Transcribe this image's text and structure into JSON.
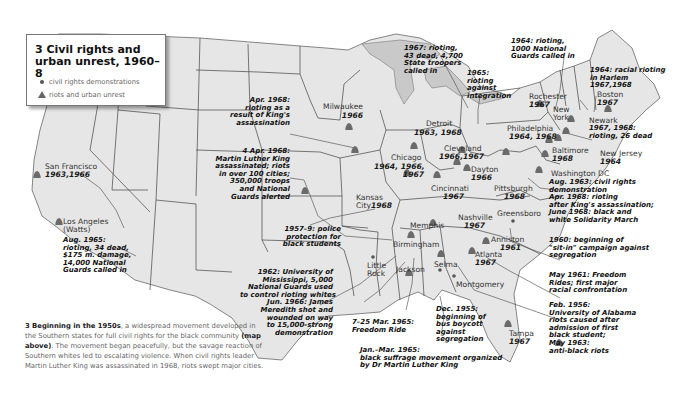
{
  "legend": {
    "title": "3 Civil rights and urban unrest, 1960–8",
    "items": [
      {
        "symbol": "dot-icon",
        "label": "civil rights demonstrations"
      },
      {
        "symbol": "riot-marker-icon",
        "label": "riots and urban unrest"
      }
    ]
  },
  "colors": {
    "land": "#e6e6e6",
    "borders": "#444444",
    "lakes": "#c9c9c9",
    "markers": "#6a6a6a",
    "background": "#ffffff"
  },
  "places": [
    {
      "id": "san-francisco",
      "name": "San Francisco",
      "years": "1963,1966",
      "type": "riot"
    },
    {
      "id": "los-angeles",
      "name": "Los Angeles (Watts)",
      "name_line1": "Los Angeles",
      "name_line2": "(Watts)",
      "type": "riot",
      "note": [
        "Aug. 1965:",
        "rioting, 34 dead,",
        "$175 m. damage,",
        "14,000 National",
        "Guards called in"
      ]
    },
    {
      "id": "milwaukee",
      "name": "Milwaukee",
      "years": "1966",
      "type": "riot"
    },
    {
      "id": "detroit",
      "name": "Detroit",
      "years": "1963, 1968",
      "type": "riot"
    },
    {
      "id": "chicago",
      "name": "Chicago",
      "years_line1": "1964, 1966,",
      "years_line2": "1967",
      "type": "riot"
    },
    {
      "id": "kansas-city",
      "name_line1": "Kansas",
      "name_line2": "City",
      "years": "1968",
      "type": "riot"
    },
    {
      "id": "cleveland",
      "name": "Cleveland",
      "years": "1966,1967",
      "type": "riot"
    },
    {
      "id": "dayton",
      "name": "Dayton",
      "years": "1966",
      "type": "riot"
    },
    {
      "id": "cincinnati",
      "name": "Cincinnati",
      "years": "1967",
      "type": "riot"
    },
    {
      "id": "pittsburgh",
      "name": "Pittsburgh",
      "years": "1968",
      "type": "riot"
    },
    {
      "id": "rochester",
      "name": "Rochester",
      "years": "1967",
      "type": "riot"
    },
    {
      "id": "boston",
      "name": "Boston",
      "years": "1967",
      "type": "riot"
    },
    {
      "id": "new-york",
      "name_line1": "New",
      "name_line2": "York",
      "type": "riot"
    },
    {
      "id": "newark",
      "name": "Newark",
      "note": [
        "1967, 1968:",
        "rioting, 26 dead"
      ],
      "type": "riot"
    },
    {
      "id": "new-jersey",
      "name": "New Jersey",
      "years": "1964",
      "type": "riot"
    },
    {
      "id": "philadelphia",
      "name": "Philadelphia",
      "years": "1964, 1968",
      "type": "riot"
    },
    {
      "id": "baltimore",
      "name": "Baltimore",
      "years": "1968",
      "type": "riot"
    },
    {
      "id": "washington-dc",
      "name": "Washington DC",
      "type": "riot",
      "note": [
        "Aug. 1963: civil rights",
        "demonstration",
        "Apr. 1968: rioting",
        "after King's assassination;",
        "June 1968: black and",
        "white Solidarity March"
      ]
    },
    {
      "id": "greensboro",
      "name": "Greensboro",
      "type": "demonstration"
    },
    {
      "id": "nashville",
      "name": "Nashville",
      "years": "1967",
      "type": "riot"
    },
    {
      "id": "memphis",
      "name": "Memphis",
      "type": "riot"
    },
    {
      "id": "little-rock",
      "name_line1": "Little",
      "name_line2": "Rock",
      "type": "demonstration"
    },
    {
      "id": "anniston",
      "name": "Anniston",
      "years": "1961",
      "type": "riot"
    },
    {
      "id": "atlanta",
      "name": "Atlanta",
      "years": "1967",
      "type": "riot"
    },
    {
      "id": "birmingham",
      "name": "Birmingham",
      "type": "riot"
    },
    {
      "id": "jackson",
      "name": "Jackson",
      "type": "riot"
    },
    {
      "id": "selma",
      "name": "Selma",
      "type": "demonstration"
    },
    {
      "id": "montgomery",
      "name": "Montgomery",
      "type": "demonstration"
    },
    {
      "id": "tampa",
      "name": "Tampa",
      "years": "1967",
      "type": "riot"
    }
  ],
  "annotations": {
    "detroit_1967": [
      "1967: rioting,",
      "43 dead, 4,700",
      "State troopers",
      "called in"
    ],
    "integration_1965": [
      "1965:",
      "rioting",
      "against",
      "integration"
    ],
    "rochester_1964": [
      "1964: rioting,",
      "1000 National",
      "Guards called in"
    ],
    "harlem_1964": [
      "1964: racial rioting",
      "in Harlem",
      "1967,1968"
    ],
    "chicago_apr_1968": [
      "Apr. 1968:",
      "rioting as a",
      "result of King's",
      "assassination"
    ],
    "memphis_4apr_1968": [
      "4 Apr. 1968:",
      "Martin Luther King",
      "assassinated; riots",
      "in over 100 cities;",
      "350,000 troops",
      "and National",
      "Guards alerted"
    ],
    "little_rock_1957": [
      "1957–9: police",
      "protection for",
      "black students"
    ],
    "jackson_1962": [
      "1962: University of",
      "Mississippi, 5,000",
      "National Guards used",
      "to control rioting whites",
      "Jun. 1966: James",
      "Meredith shot and",
      "wounded on way",
      "to 15,000-strong",
      "demonstration"
    ],
    "freedom_ride_1965": [
      "7–25 Mar. 1965:",
      "Freedom Ride"
    ],
    "montgomery_1955": [
      "Dec. 1955:",
      "beginning of",
      "bus boycott",
      "against",
      "segregation"
    ],
    "selma_1965": [
      "Jan.–Mar. 1965:",
      "black suffrage movement organized",
      "by Dr Martin Luther King"
    ],
    "greensboro_1960": [
      "1960: beginning of",
      "\"sit-in\" campaign against",
      "segregation"
    ],
    "anniston_1961": [
      "May 1961: Freedom",
      "Rides; first major",
      "racial confrontation"
    ],
    "birmingham_1956": [
      "Feb. 1956:",
      "University of Alabama",
      "riots caused after",
      "admission of first",
      "black student;",
      "May 1963:",
      "anti-black riots"
    ]
  },
  "caption": {
    "lead": "3 Beginning in the 1950s",
    "text1": ", a widespread movement developed in the Southern states for full civil rights for the black community ",
    "ref": "(map above)",
    "text2": ". The movement began peacefully, but the savage reaction of Southern whites led to escalating violence. When civil rights leader Martin Luther King was assassinated in 1968, riots swept major cities."
  }
}
